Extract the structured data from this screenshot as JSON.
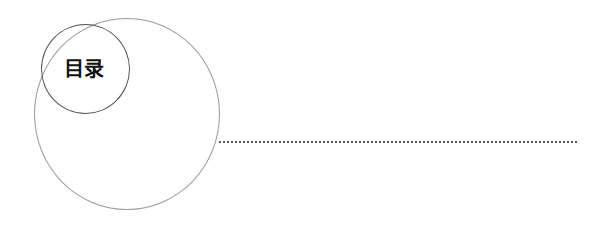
{
  "heading": {
    "title": "目录"
  },
  "decor": {
    "big_circle_color": "#9a9a9a",
    "small_circle_color": "#555555",
    "dotted_line_color": "#555555"
  }
}
